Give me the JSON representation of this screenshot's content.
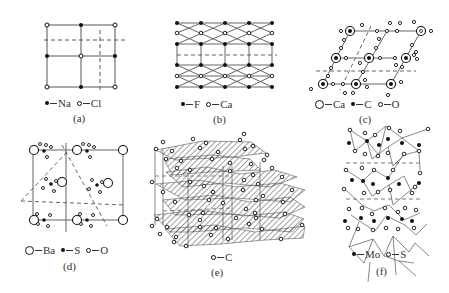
{
  "figure": {
    "panels": [
      {
        "id": "a",
        "caption": "(a)",
        "legend": [
          {
            "symbol": "filled-dot",
            "label": "Na"
          },
          {
            "symbol": "open-dot",
            "label": "Cl"
          }
        ]
      },
      {
        "id": "b",
        "caption": "(b)",
        "legend": [
          {
            "symbol": "filled-dot",
            "label": "F"
          },
          {
            "symbol": "open-dot",
            "label": "Ca"
          }
        ]
      },
      {
        "id": "c",
        "caption": "(c)",
        "legend": [
          {
            "symbol": "large-open-circle",
            "label": "Ca"
          },
          {
            "symbol": "filled-dot",
            "label": "C"
          },
          {
            "symbol": "open-dot",
            "label": "O"
          }
        ]
      },
      {
        "id": "d",
        "caption": "(d)",
        "legend": [
          {
            "symbol": "large-open-circle",
            "label": "Ba"
          },
          {
            "symbol": "filled-dot",
            "label": "S"
          },
          {
            "symbol": "open-dot",
            "label": "O"
          }
        ]
      },
      {
        "id": "e",
        "caption": "(e)",
        "legend": [
          {
            "symbol": "open-dot",
            "label": "C"
          }
        ]
      },
      {
        "id": "f",
        "caption": "(f)",
        "legend": [
          {
            "symbol": "filled-dot",
            "label": "Mo"
          },
          {
            "symbol": "open-dot",
            "label": "S"
          }
        ]
      }
    ],
    "colors": {
      "line": "#555555",
      "atom": "#111111",
      "hatch": "#444444",
      "background": "#ffffff"
    }
  }
}
